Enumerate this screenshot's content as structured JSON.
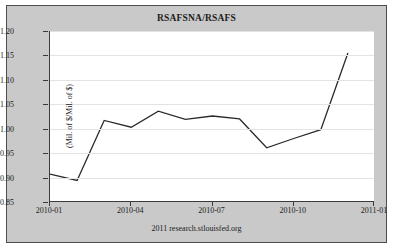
{
  "chart_data": {
    "type": "line",
    "title": "RSAFSNA/RSAFS",
    "xlabel": "",
    "ylabel": "(Mil. of $/Mil. of $)",
    "ylim": [
      0.85,
      1.2
    ],
    "ytick_labels": [
      "0.85",
      "0.90",
      "0.95",
      "1.00",
      "1.05",
      "1.10",
      "1.15",
      "1.20"
    ],
    "ytick_values": [
      0.85,
      0.9,
      0.95,
      1.0,
      1.05,
      1.1,
      1.15,
      1.2
    ],
    "xtick_labels": [
      "2010-01",
      "2010-04",
      "2010-07",
      "2010-10",
      "2011-01"
    ],
    "xlim": [
      "2010-01",
      "2011-01"
    ],
    "grid": true,
    "legend": false,
    "line_color": "#2b2b2b",
    "series": [
      {
        "name": "RSAFSNA/RSAFS",
        "x": [
          "2010-01",
          "2010-02",
          "2010-03",
          "2010-04",
          "2010-05",
          "2010-06",
          "2010-07",
          "2010-08",
          "2010-09",
          "2010-10",
          "2010-11",
          "2010-12"
        ],
        "values": [
          0.907,
          0.894,
          1.017,
          1.003,
          1.036,
          1.019,
          1.026,
          1.02,
          0.961,
          0.98,
          0.998,
          1.155
        ]
      }
    ]
  },
  "footer": {
    "source": "2011 research.stlouisfed.org"
  }
}
